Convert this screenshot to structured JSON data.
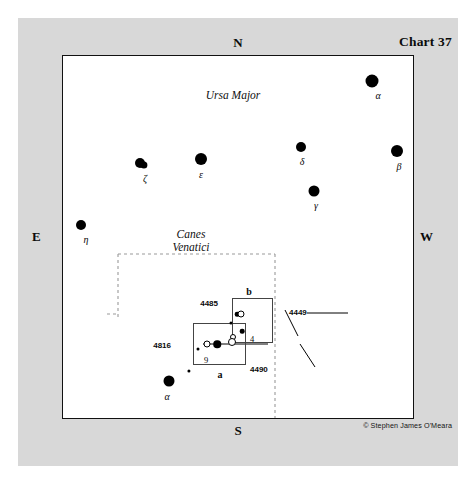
{
  "chart": {
    "title": "Chart 37",
    "copyright": "© Stephen James O'Meara",
    "compass": {
      "north": "N",
      "south": "S",
      "east": "E",
      "west": "W"
    }
  },
  "constellations": [
    {
      "name": "Ursa Major",
      "x": 232,
      "y": 95
    },
    {
      "name": "Canes\nVenatici",
      "x": 190,
      "y": 240
    }
  ],
  "chart_data": {
    "type": "scatter",
    "title": "Chart 37",
    "xlabel": "",
    "ylabel": "",
    "stars": [
      {
        "label": "α",
        "bayer": "alpha",
        "constellation": "Ursa Major",
        "x": 371,
        "y": 80,
        "size": 13,
        "label_dx": 6,
        "label_dy": 9
      },
      {
        "label": "β",
        "bayer": "beta",
        "constellation": "Ursa Major",
        "x": 396,
        "y": 150,
        "size": 12,
        "label_dx": 2,
        "label_dy": 10
      },
      {
        "label": "δ",
        "bayer": "delta",
        "constellation": "Ursa Major",
        "x": 300,
        "y": 146,
        "size": 10,
        "label_dx": 1,
        "label_dy": 9
      },
      {
        "label": "γ",
        "bayer": "gamma",
        "constellation": "Ursa Major",
        "x": 313,
        "y": 190,
        "size": 11,
        "label_dx": 2,
        "label_dy": 9
      },
      {
        "label": "ε",
        "bayer": "epsilon",
        "constellation": "Ursa Major",
        "x": 200,
        "y": 158,
        "size": 12,
        "label_dx": 0,
        "label_dy": 10
      },
      {
        "label": "ζ",
        "bayer": "zeta",
        "constellation": "Ursa Major",
        "x": 139,
        "y": 162,
        "size": 10,
        "label_dx": 5,
        "label_dy": 10,
        "double": true
      },
      {
        "label": "η",
        "bayer": "eta",
        "constellation": "Ursa Major",
        "x": 80,
        "y": 224,
        "size": 10,
        "label_dx": 5,
        "label_dy": 9
      },
      {
        "label": "α",
        "bayer": "alpha",
        "constellation": "Canes Venatici",
        "x": 168,
        "y": 380,
        "size": 11,
        "label_dx": -2,
        "label_dy": 10
      }
    ],
    "faint_stars": [
      {
        "x": 188,
        "y": 370,
        "size": 3.2
      },
      {
        "x": 197,
        "y": 348,
        "size": 3.0
      },
      {
        "x": 230,
        "y": 322,
        "size": 3.0
      },
      {
        "x": 236,
        "y": 313,
        "size": 4.6
      },
      {
        "x": 241,
        "y": 330,
        "size": 4.6
      },
      {
        "x": 216,
        "y": 343,
        "size": 7.5
      }
    ],
    "galaxies": [
      {
        "designation": "4816",
        "x": 206,
        "y": 343,
        "size": 7
      },
      {
        "designation": "4485",
        "x": 232,
        "y": 336,
        "size": 6
      },
      {
        "designation": "4490",
        "x": 231,
        "y": 341,
        "size": 8
      },
      {
        "designation": "4449",
        "x": 240,
        "y": 313,
        "size": 7
      }
    ],
    "star_labels_plain": [
      {
        "text": "9",
        "x": 205,
        "y": 354
      },
      {
        "text": "4",
        "x": 251,
        "y": 333
      }
    ],
    "inset_boxes": [
      {
        "label": "a",
        "x": 192,
        "y": 322,
        "w": 53,
        "h": 42,
        "label_x": 219,
        "label_y": 368
      },
      {
        "label": "b",
        "x": 231,
        "y": 297,
        "w": 41,
        "h": 45,
        "label_x": 248,
        "label_y": 285
      }
    ],
    "callouts": [
      {
        "designation": "4449",
        "label_x": 288,
        "label_y": 311,
        "anchor": "right"
      },
      {
        "designation": "4485",
        "label_x": 217,
        "label_y": 302,
        "anchor": "left"
      },
      {
        "designation": "4490",
        "label_x": 249,
        "label_y": 368,
        "anchor": "right"
      },
      {
        "designation": "4816",
        "label_x": 170,
        "label_y": 344,
        "anchor": "left"
      }
    ]
  }
}
